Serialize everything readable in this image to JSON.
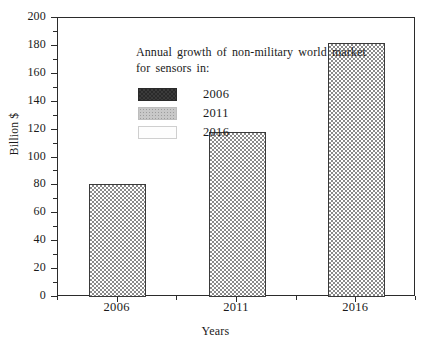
{
  "chart_data": {
    "type": "bar",
    "title": "",
    "categories": [
      "2006",
      "2011",
      "2016"
    ],
    "values": [
      81,
      118,
      182
    ],
    "xlabel": "Years",
    "ylabel": "Billion $",
    "ylim": [
      0,
      200
    ],
    "ytick_step": 20,
    "yticks": [
      "200",
      "180",
      "160",
      "140",
      "120",
      "100",
      "80",
      "60",
      "40",
      "20",
      "0"
    ],
    "minor_ticks": true,
    "grid": false,
    "frame": true,
    "legend": {
      "position": "inside-top-left",
      "title": "Annual growth of non-military world market for sensors in:",
      "entries": [
        {
          "label": "2006",
          "swatch": "dark"
        },
        {
          "label": "2011",
          "swatch": "gray"
        },
        {
          "label": "2016",
          "swatch": "light"
        }
      ]
    },
    "series": [
      {
        "name": "Annual growth of non-military world market for sensors",
        "values": [
          81,
          118,
          182
        ]
      }
    ],
    "colors": {
      "bar_fill": "#8a8a8a",
      "bar_outline": "#3a3a3a",
      "axis": "#2b2b2b",
      "background": "#ffffff",
      "text": "#1a1a1a"
    }
  }
}
